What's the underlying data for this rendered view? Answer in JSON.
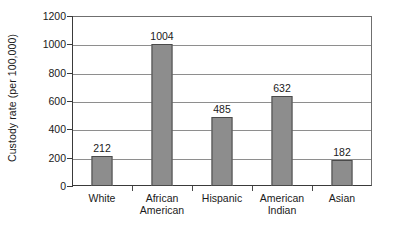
{
  "chart_data": {
    "type": "bar",
    "title": "",
    "subtitle": "",
    "xlabel": "",
    "ylabel": "Custody rate (per 100,000)",
    "categories": [
      "White",
      "African American",
      "Hispanic",
      "American Indian",
      "Asian"
    ],
    "category_lines": [
      [
        "White",
        ""
      ],
      [
        "African",
        "American"
      ],
      [
        "Hispanic",
        ""
      ],
      [
        "American",
        "Indian"
      ],
      [
        "Asian",
        ""
      ]
    ],
    "values": [
      212,
      1004,
      485,
      632,
      182
    ],
    "value_labels": [
      "212",
      "1004",
      "485",
      "632",
      "182"
    ],
    "ylim": [
      0,
      1200
    ],
    "y_ticks": [
      0,
      200,
      400,
      600,
      800,
      1000,
      1200
    ],
    "y_tick_labels": [
      "0",
      "200",
      "400",
      "600",
      "800",
      "1000",
      "1200"
    ],
    "grid": true,
    "grid_axis": "y",
    "legend": false,
    "legend_position": "none",
    "bar_fill_color": "#8d8d8d",
    "bar_border_color": "#4a4a4a",
    "gridline_color": "#8e8e8e",
    "axis_color": "#3a3a3a"
  }
}
